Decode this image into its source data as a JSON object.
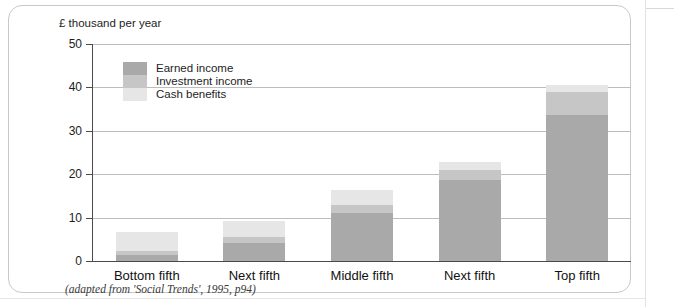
{
  "figure": {
    "axis_unit_label": "£ thousand per year",
    "source_caption": "(adapted from 'Social Trends', 1995, p94)"
  },
  "legend": {
    "items": [
      {
        "label": "Earned income",
        "color": "#a9a9a9"
      },
      {
        "label": "Investment income",
        "color": "#c6c6c6"
      },
      {
        "label": "Cash benefits",
        "color": "#e6e6e6"
      }
    ]
  },
  "chart_data": {
    "type": "bar",
    "stacked": true,
    "title": "",
    "subtitle": "",
    "xlabel": "",
    "ylabel": "£ thousand per year",
    "ylim": [
      0,
      50
    ],
    "yticks": [
      0,
      10,
      20,
      30,
      40,
      50
    ],
    "ytick_labels": [
      "0",
      "10",
      "20",
      "30",
      "40",
      "50"
    ],
    "grid": true,
    "legend_position": "inside-top-left",
    "categories": [
      "Bottom fifth",
      "Next fifth",
      "Middle fifth",
      "Next fifth",
      "Top fifth"
    ],
    "series": [
      {
        "name": "Earned income",
        "color": "#a9a9a9",
        "values": [
          1.5,
          4.2,
          11.0,
          18.7,
          33.7
        ]
      },
      {
        "name": "Investment income",
        "color": "#c6c6c6",
        "values": [
          0.7,
          1.3,
          2.0,
          2.3,
          5.3
        ]
      },
      {
        "name": "Cash benefits",
        "color": "#e6e6e6",
        "values": [
          4.5,
          3.7,
          3.3,
          1.8,
          1.5
        ]
      }
    ],
    "totals": [
      6.7,
      9.2,
      16.3,
      22.8,
      40.5
    ],
    "annotations": [
      "(adapted from 'Social Trends', 1995, p94)"
    ]
  }
}
